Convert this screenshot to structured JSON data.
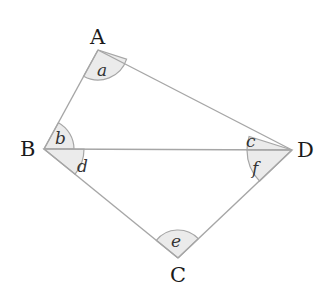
{
  "diagram": {
    "vertices": {
      "A": {
        "label": "A",
        "x": 98,
        "y": 50
      },
      "B": {
        "label": "B",
        "x": 44,
        "y": 149
      },
      "C": {
        "label": "C",
        "x": 178,
        "y": 258
      },
      "D": {
        "label": "D",
        "x": 292,
        "y": 150
      }
    },
    "edges": [
      "AB",
      "AD",
      "BD",
      "BC",
      "CD"
    ],
    "angles": {
      "a": {
        "label": "a",
        "vertex": "A"
      },
      "b": {
        "label": "b",
        "vertex": "B"
      },
      "c": {
        "label": "c",
        "vertex": "D"
      },
      "d": {
        "label": "d",
        "vertex": "B"
      },
      "e": {
        "label": "e",
        "vertex": "C"
      },
      "f": {
        "label": "f",
        "vertex": "D"
      }
    },
    "colors": {
      "edge": "#a6a6a6",
      "angle_fill": "#ebebeb",
      "text": "#1a1a1a"
    }
  }
}
